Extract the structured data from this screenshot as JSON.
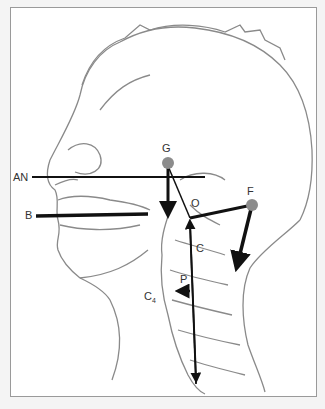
{
  "figure": {
    "labels": {
      "AN": "AN",
      "B": "B",
      "G": "G",
      "O": "O",
      "F": "F",
      "C": "C",
      "P": "P",
      "C4_main": "C",
      "C4_sub": "4"
    },
    "colors": {
      "outline": "#8a8a8a",
      "vector": "#111111",
      "point": "#8c8c8c",
      "background": "#ffffff",
      "frame_border": "#9a9a9a"
    }
  }
}
